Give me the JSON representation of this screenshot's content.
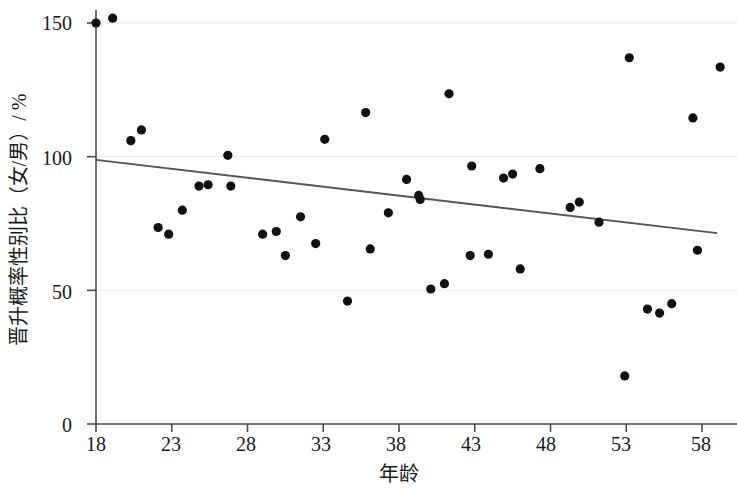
{
  "chart_data": {
    "type": "scatter",
    "title": "",
    "xlabel": "年龄",
    "ylabel": "晋升概率性别比（女/男）/ %",
    "xlim": [
      17.0,
      60.0
    ],
    "ylim": [
      0,
      160
    ],
    "xticks": [
      18,
      23,
      28,
      33,
      38,
      43,
      48,
      53,
      58
    ],
    "ytick_labels": [
      "0",
      "50",
      "100",
      "150"
    ],
    "yticks": [
      0,
      50,
      100,
      150
    ],
    "grid": true,
    "grid_axis": "y",
    "legend": "none",
    "marker": "filled-circle",
    "marker_color": "#111111",
    "series": [
      {
        "name": "晋升概率性别比（女/男）",
        "type": "scatter",
        "points": [
          {
            "x": 18.0,
            "y": 150.0
          },
          {
            "x": 19.1,
            "y": 151.8
          },
          {
            "x": 20.3,
            "y": 106.0
          },
          {
            "x": 21.0,
            "y": 110.0
          },
          {
            "x": 22.1,
            "y": 73.5
          },
          {
            "x": 22.8,
            "y": 71.0
          },
          {
            "x": 23.7,
            "y": 80.0
          },
          {
            "x": 24.8,
            "y": 89.0
          },
          {
            "x": 25.4,
            "y": 89.5
          },
          {
            "x": 26.7,
            "y": 100.5
          },
          {
            "x": 26.9,
            "y": 89.0
          },
          {
            "x": 29.0,
            "y": 71.0
          },
          {
            "x": 29.9,
            "y": 72.0
          },
          {
            "x": 30.5,
            "y": 63.0
          },
          {
            "x": 31.5,
            "y": 77.5
          },
          {
            "x": 32.5,
            "y": 67.5
          },
          {
            "x": 33.1,
            "y": 106.5
          },
          {
            "x": 34.6,
            "y": 46.0
          },
          {
            "x": 35.8,
            "y": 116.5
          },
          {
            "x": 36.1,
            "y": 65.5
          },
          {
            "x": 37.3,
            "y": 79.0
          },
          {
            "x": 38.5,
            "y": 91.5
          },
          {
            "x": 39.3,
            "y": 85.5
          },
          {
            "x": 39.4,
            "y": 84.0
          },
          {
            "x": 40.1,
            "y": 50.5
          },
          {
            "x": 41.3,
            "y": 123.5
          },
          {
            "x": 41.0,
            "y": 52.5
          },
          {
            "x": 42.8,
            "y": 96.5
          },
          {
            "x": 42.7,
            "y": 63.0
          },
          {
            "x": 43.9,
            "y": 63.5
          },
          {
            "x": 44.9,
            "y": 92.0
          },
          {
            "x": 45.5,
            "y": 93.5
          },
          {
            "x": 46.0,
            "y": 58.0
          },
          {
            "x": 47.3,
            "y": 95.5
          },
          {
            "x": 49.3,
            "y": 81.0
          },
          {
            "x": 49.9,
            "y": 83.0
          },
          {
            "x": 51.2,
            "y": 75.5
          },
          {
            "x": 52.9,
            "y": 18.0
          },
          {
            "x": 53.2,
            "y": 137.0
          },
          {
            "x": 54.4,
            "y": 43.0
          },
          {
            "x": 55.2,
            "y": 41.5
          },
          {
            "x": 56.0,
            "y": 45.0
          },
          {
            "x": 57.4,
            "y": 114.5
          },
          {
            "x": 57.7,
            "y": 65.0
          },
          {
            "x": 59.2,
            "y": 133.5
          }
        ]
      },
      {
        "name": "线性趋势线",
        "type": "line",
        "color": "#555555",
        "x_start": 18.0,
        "y_start": 98.8,
        "x_end": 59.0,
        "y_end": 71.4
      }
    ]
  },
  "axes": {
    "y_title": "晋升概率性别比（女/男）/ %",
    "x_title": "年龄",
    "y_tick_labels": [
      "150",
      "100",
      "50",
      "0"
    ],
    "x_tick_labels": [
      "18",
      "23",
      "28",
      "33",
      "38",
      "43",
      "48",
      "53",
      "58"
    ]
  },
  "colors": {
    "marker": "#111111",
    "axis": "#4a4a4a",
    "grid": "#f0eeee",
    "trendline": "#555555",
    "background": "#ffffff"
  }
}
